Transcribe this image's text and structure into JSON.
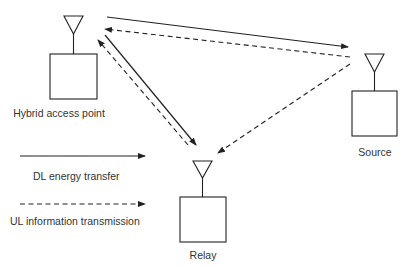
{
  "diagram": {
    "nodes": [
      {
        "id": "hap",
        "label": "Hybrid access point"
      },
      {
        "id": "source",
        "label": "Source"
      },
      {
        "id": "relay",
        "label": "Relay"
      }
    ],
    "edges": [
      {
        "from": "hap",
        "to": "source",
        "style": "solid",
        "meaning": "DL energy transfer"
      },
      {
        "from": "source",
        "to": "hap",
        "style": "dashed",
        "meaning": "UL information transmission"
      },
      {
        "from": "hap",
        "to": "relay",
        "style": "solid",
        "meaning": "DL energy transfer"
      },
      {
        "from": "relay",
        "to": "hap",
        "style": "dashed",
        "meaning": "UL information transmission"
      },
      {
        "from": "source",
        "to": "relay",
        "style": "dashed",
        "meaning": "UL information transmission"
      }
    ],
    "legend": [
      {
        "style": "solid",
        "label": "DL energy transfer"
      },
      {
        "style": "dashed",
        "label": "UL information transmission"
      }
    ],
    "colors": {
      "stroke": "#222222",
      "text": "#333333",
      "background": "#ffffff"
    }
  }
}
